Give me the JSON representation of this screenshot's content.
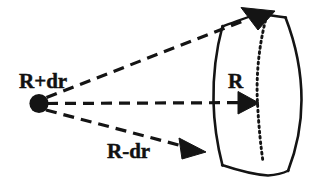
{
  "figure": {
    "name": "solid-angle-shell-element-diagram",
    "background_color": "#ffffff",
    "ink_color": "#141414",
    "width": 324,
    "height": 184,
    "labels": {
      "apex_label": "R+dr",
      "lower_ray_label": "R-dr",
      "middle_ray_label": "R"
    },
    "elements": {
      "vertex_dot_name": "vertex-dot",
      "upper_ray_name": "upper-dashed-ray",
      "middle_ray_name": "middle-dashed-ray",
      "lower_ray_name": "lower-dashed-ray",
      "inner_arc_name": "inner-solid-arc",
      "dotted_arc_name": "middle-dotted-arc",
      "outer_arc_name": "outer-solid-arc",
      "top_edge_name": "top-solid-edge",
      "bottom_edge_name": "bottom-solid-edge",
      "upper_arrowhead_name": "upper-arrowhead",
      "middle_arrowhead_name": "middle-arrowhead",
      "lower_arrowhead_name": "lower-arrowhead"
    },
    "style": {
      "dash_pattern": "11 7",
      "dot_pattern": "1.6 3.4",
      "ray_stroke_width": 3.2,
      "arc_stroke_width": 2.4,
      "vertex_radius": 9.5,
      "label_font_size": 20
    }
  }
}
